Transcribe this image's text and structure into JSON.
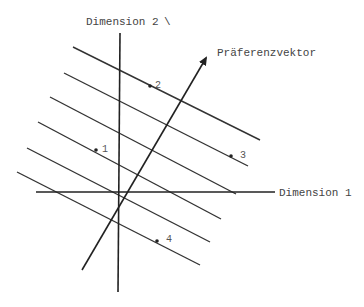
{
  "diagram": {
    "type": "ideal-vector-model",
    "axes": {
      "x": {
        "label": "Dimension 1"
      },
      "y": {
        "label": "Dimension 2"
      }
    },
    "vector": {
      "label": "Präferenzvektor"
    },
    "points": [
      {
        "label": "1"
      },
      {
        "label": "2"
      },
      {
        "label": "3"
      },
      {
        "label": "4"
      }
    ],
    "iso_preference_lines": 6
  }
}
